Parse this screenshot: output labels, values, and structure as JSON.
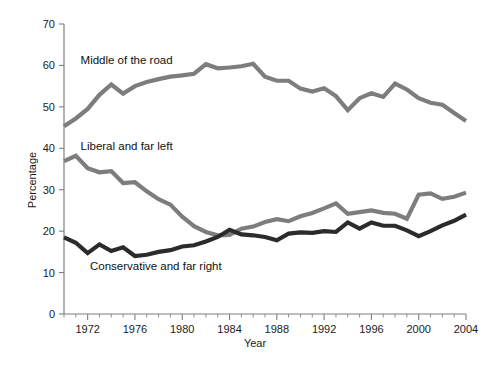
{
  "chart_data": {
    "type": "line",
    "title": "",
    "xlabel": "Year",
    "ylabel": "Percentage",
    "xlim": [
      1970,
      2004
    ],
    "ylim": [
      0,
      70
    ],
    "ytick_step": 10,
    "yticks": [
      0,
      10,
      20,
      30,
      40,
      50,
      60,
      70
    ],
    "xticks_labeled": [
      1972,
      1976,
      1980,
      1984,
      1988,
      1992,
      1996,
      2000,
      2004
    ],
    "xtick_minor_step": 1,
    "grid": false,
    "legend_position": "inline-annotations",
    "x": [
      1970,
      1971,
      1972,
      1973,
      1974,
      1975,
      1976,
      1977,
      1978,
      1979,
      1980,
      1981,
      1982,
      1983,
      1984,
      1985,
      1986,
      1987,
      1988,
      1989,
      1990,
      1991,
      1992,
      1993,
      1994,
      1995,
      1996,
      1997,
      1998,
      1999,
      2000,
      2001,
      2002,
      2003,
      2004
    ],
    "series": [
      {
        "name": "Middle of the road",
        "color": "#7d7d7d",
        "label_x": 1971.4,
        "label_y": 61.2,
        "values": [
          45.3,
          47.2,
          49.5,
          52.9,
          55.4,
          53.2,
          55.0,
          56.0,
          56.7,
          57.3,
          57.6,
          58.0,
          60.3,
          59.3,
          59.5,
          59.8,
          60.4,
          57.3,
          56.3,
          56.3,
          54.4,
          53.7,
          54.5,
          52.6,
          49.2,
          52.1,
          53.3,
          52.4,
          55.6,
          54.2,
          52.1,
          51.0,
          50.5,
          48.5,
          46.6
        ]
      },
      {
        "name": "Liberal and far left",
        "color": "#7d7d7d",
        "label_x": 1971.4,
        "label_y": 40.6,
        "values": [
          36.9,
          38.2,
          35.2,
          34.2,
          34.5,
          31.6,
          31.8,
          29.6,
          27.7,
          26.4,
          23.5,
          21.2,
          19.8,
          19.0,
          19.1,
          20.6,
          21.1,
          22.2,
          22.9,
          22.4,
          23.6,
          24.4,
          25.5,
          26.7,
          24.2,
          24.6,
          25.0,
          24.4,
          24.2,
          23.0,
          28.8,
          29.1,
          27.8,
          28.3,
          29.3
        ]
      },
      {
        "name": "Conservative and far right",
        "color": "#2b2b2b",
        "label_x": 1972.2,
        "label_y": 11.5,
        "values": [
          18.5,
          17.2,
          14.7,
          16.8,
          15.2,
          16.1,
          14.0,
          14.3,
          15.0,
          15.4,
          16.3,
          16.6,
          17.5,
          18.6,
          20.3,
          19.2,
          19.0,
          18.6,
          17.8,
          19.4,
          19.7,
          19.6,
          20.0,
          19.8,
          22.1,
          20.6,
          22.1,
          21.3,
          21.3,
          20.2,
          18.8,
          20.0,
          21.4,
          22.5,
          24.0
        ]
      }
    ]
  },
  "axis": {
    "y_label": "Percentage",
    "x_label": "Year",
    "y_tick_labels": [
      "0",
      "10",
      "20",
      "30",
      "40",
      "50",
      "60",
      "70"
    ],
    "x_tick_labels": [
      "1972",
      "1976",
      "1980",
      "1984",
      "1988",
      "1992",
      "1996",
      "2000",
      "2004"
    ]
  }
}
